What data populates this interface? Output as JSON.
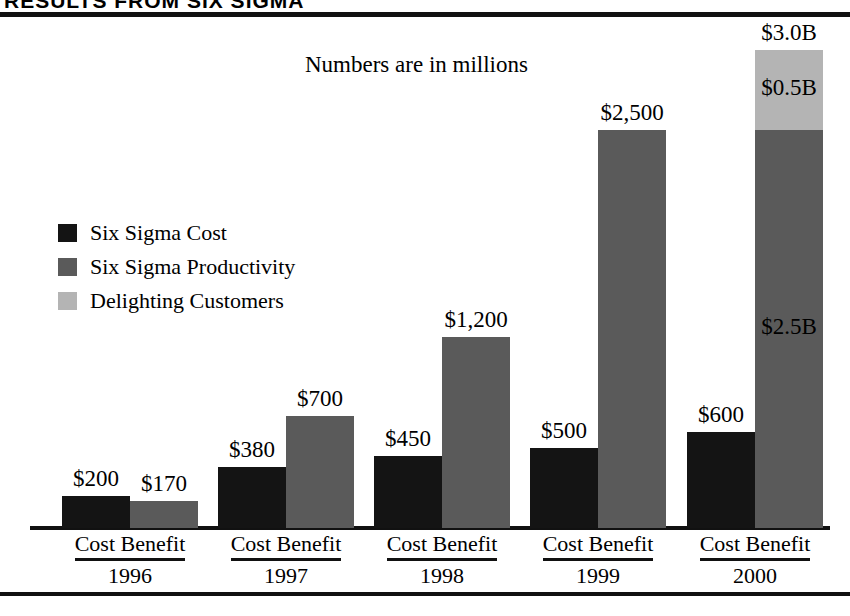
{
  "header": {
    "title": "RESULTS FROM SIX SIGMA"
  },
  "chart_data": {
    "type": "bar",
    "title": "RESULTS FROM SIX SIGMA",
    "subtitle": "Numbers are in millions",
    "xlabel": "",
    "ylabel": "",
    "grid": false,
    "legend_position": "left-middle",
    "axis_group_label": "Cost Benefit",
    "categories": [
      "1996",
      "1997",
      "1998",
      "1999",
      "2000"
    ],
    "legend": [
      {
        "name": "Six Sigma Cost",
        "color": "#141414"
      },
      {
        "name": "Six Sigma Productivity",
        "color": "#5a5a5a"
      },
      {
        "name": "Delighting Customers",
        "color": "#b4b4b4"
      }
    ],
    "series": [
      {
        "name": "Six Sigma Cost",
        "color": "#141414",
        "values": [
          200,
          380,
          450,
          500,
          600
        ]
      },
      {
        "name": "Six Sigma Productivity",
        "color": "#5a5a5a",
        "values": [
          170,
          700,
          1200,
          2500,
          2500
        ]
      },
      {
        "name": "Delighting Customers",
        "color": "#b4b4b4",
        "values": [
          0,
          0,
          0,
          0,
          500
        ]
      }
    ],
    "ylim": [
      0,
      3000
    ],
    "groups": [
      {
        "year": "1996",
        "cost": {
          "label": "$200",
          "value": 200,
          "color": "#141414"
        },
        "benefit": {
          "label": "$170",
          "total": 170,
          "stack": [
            {
              "name": "Six Sigma Productivity",
              "value": 170,
              "color": "#5a5a5a",
              "label": ""
            }
          ]
        }
      },
      {
        "year": "1997",
        "cost": {
          "label": "$380",
          "value": 380,
          "color": "#141414"
        },
        "benefit": {
          "label": "$700",
          "total": 700,
          "stack": [
            {
              "name": "Six Sigma Productivity",
              "value": 700,
              "color": "#5a5a5a",
              "label": ""
            }
          ]
        }
      },
      {
        "year": "1998",
        "cost": {
          "label": "$450",
          "value": 450,
          "color": "#141414"
        },
        "benefit": {
          "label": "$1,200",
          "total": 1200,
          "stack": [
            {
              "name": "Six Sigma Productivity",
              "value": 1200,
              "color": "#5a5a5a",
              "label": ""
            }
          ]
        }
      },
      {
        "year": "1999",
        "cost": {
          "label": "$500",
          "value": 500,
          "color": "#141414"
        },
        "benefit": {
          "label": "$2,500",
          "total": 2500,
          "stack": [
            {
              "name": "Six Sigma Productivity",
              "value": 2500,
              "color": "#5a5a5a",
              "label": ""
            }
          ]
        }
      },
      {
        "year": "2000",
        "cost": {
          "label": "$600",
          "value": 600,
          "color": "#141414"
        },
        "benefit": {
          "label": "$3.0B",
          "total": 3000,
          "stack": [
            {
              "name": "Six Sigma Productivity",
              "value": 2500,
              "color": "#5a5a5a",
              "label": "$2.5B"
            },
            {
              "name": "Delighting Customers",
              "value": 500,
              "color": "#b4b4b4",
              "label": "$0.5B"
            }
          ]
        }
      }
    ]
  }
}
